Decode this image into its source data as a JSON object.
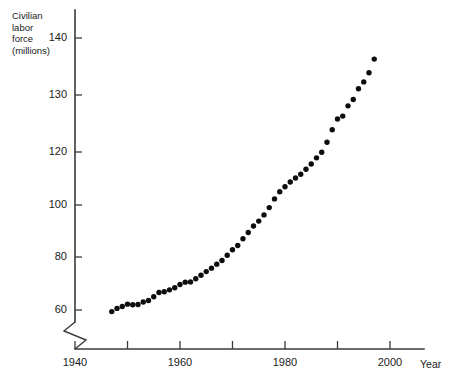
{
  "chart_data": {
    "type": "scatter",
    "title": "",
    "subtitle": "",
    "xlabel": "Year",
    "ylabel": "Civilian labor force (millions)",
    "ylabel_lines": [
      "Civilian",
      "labor",
      "force",
      "(millions)"
    ],
    "xlim": [
      1940,
      2002
    ],
    "ylim": [
      58,
      142
    ],
    "grid": false,
    "legend": null,
    "y_axis_broken": true,
    "y_axis_break_note": "zigzag break symbol on vertical axis below the 60 tick",
    "y_scale_note": "non-uniform: 20-unit spacing between 60 and 120, 10-unit spacing between 120 and 140",
    "xticks": [
      1940,
      1950,
      1960,
      1970,
      1980,
      1990,
      2000
    ],
    "xtick_labels": [
      "1940",
      "",
      "1960",
      "",
      "1980",
      "",
      "2000"
    ],
    "yticks": [
      60,
      80,
      100,
      120,
      130,
      140
    ],
    "ytick_labels": [
      "60",
      "80",
      "100",
      "120",
      "130",
      "140"
    ],
    "marker": "filled-circle",
    "marker_color": "#0d0d0d",
    "x": [
      1947,
      1948,
      1949,
      1950,
      1951,
      1952,
      1953,
      1954,
      1955,
      1956,
      1957,
      1958,
      1959,
      1960,
      1961,
      1962,
      1963,
      1964,
      1965,
      1966,
      1967,
      1968,
      1969,
      1970,
      1971,
      1972,
      1973,
      1974,
      1975,
      1976,
      1977,
      1978,
      1979,
      1980,
      1981,
      1982,
      1983,
      1984,
      1985,
      1986,
      1987,
      1988,
      1989,
      1990,
      1991,
      1992,
      1993,
      1994,
      1995,
      1996,
      1997
    ],
    "y": [
      59.4,
      60.6,
      61.3,
      62.2,
      62.0,
      62.1,
      63.0,
      63.6,
      65.0,
      66.6,
      66.9,
      67.6,
      68.4,
      69.6,
      70.5,
      70.6,
      71.8,
      73.1,
      74.5,
      75.8,
      77.3,
      78.7,
      80.7,
      82.8,
      84.4,
      87.0,
      89.4,
      91.9,
      93.8,
      96.2,
      99.0,
      102.3,
      105.0,
      106.9,
      108.7,
      110.2,
      111.6,
      113.5,
      115.5,
      117.8,
      119.9,
      121.7,
      123.9,
      125.8,
      126.3,
      128.1,
      129.2,
      131.1,
      132.3,
      133.9,
      136.3
    ],
    "data_label_units": "millions of persons",
    "point_count": 51
  },
  "chart": {
    "x_axis_name": "Year",
    "y_axis_title": "Civilian\nlabor\nforce\n(millions)"
  }
}
